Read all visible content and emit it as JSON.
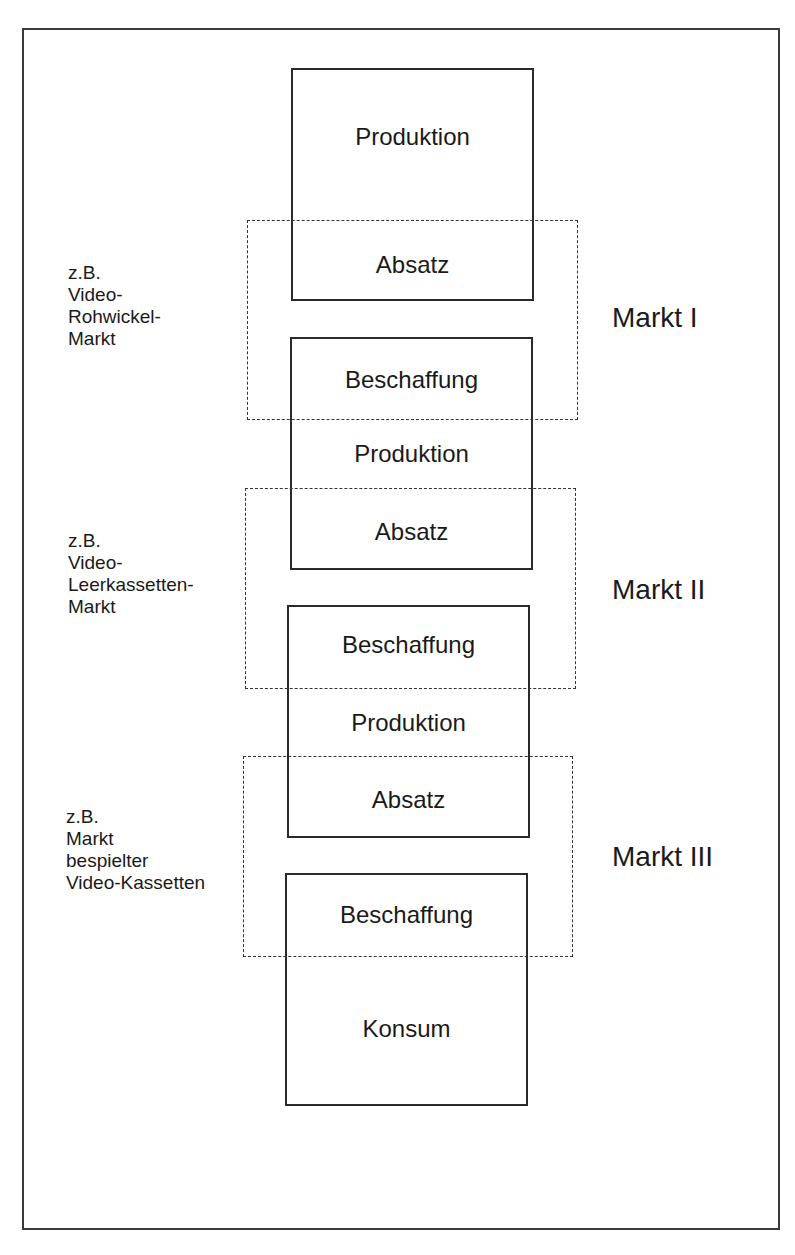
{
  "diagram": {
    "stages": [
      {
        "id": "stage-1",
        "labels": [
          "Produktion",
          "Absatz"
        ]
      },
      {
        "id": "stage-2",
        "labels": [
          "Beschaffung",
          "Produktion",
          "Absatz"
        ]
      },
      {
        "id": "stage-3",
        "labels": [
          "Beschaffung",
          "Produktion",
          "Absatz"
        ]
      },
      {
        "id": "stage-4",
        "labels": [
          "Beschaffung",
          "Konsum"
        ]
      }
    ],
    "markets": [
      {
        "name": "Markt I",
        "example_lines": [
          "z.B.",
          "Video-",
          "Rohwickel-",
          "Markt"
        ]
      },
      {
        "name": "Markt II",
        "example_lines": [
          "z.B.",
          "Video-",
          "Leerkassetten-",
          "Markt"
        ]
      },
      {
        "name": "Markt III",
        "example_lines": [
          "z.B.",
          "Markt",
          "bespielter",
          "Video-Kassetten"
        ]
      }
    ]
  }
}
